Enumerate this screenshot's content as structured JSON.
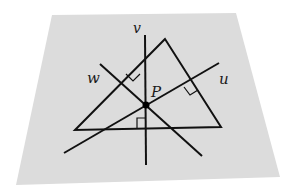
{
  "figure": {
    "plane": {
      "fill": "#dcdcdc",
      "corners": [
        [
          52,
          15
        ],
        [
          236,
          13
        ],
        [
          280,
          177
        ],
        [
          16,
          185
        ]
      ]
    },
    "stroke_color": "#111111",
    "triangle": {
      "vertices": [
        [
          165,
          39
        ],
        [
          75,
          130
        ],
        [
          221,
          127
        ]
      ]
    },
    "lines": [
      {
        "name": "v",
        "label": "v",
        "from": [
          145,
          35
        ],
        "to": [
          146,
          165
        ],
        "label_pos": [
          133,
          33
        ]
      },
      {
        "name": "u",
        "label": "u",
        "from": [
          64,
          153
        ],
        "to": [
          219,
          63
        ],
        "label_pos": [
          219,
          84
        ]
      },
      {
        "name": "w",
        "label": "w",
        "from": [
          100,
          64
        ],
        "to": [
          202,
          156
        ],
        "label_pos": [
          87,
          83
        ]
      }
    ],
    "point": {
      "label": "P",
      "pos": [
        146,
        105
      ],
      "label_pos": [
        151,
        97
      ]
    },
    "right_angle_marks": [
      "w-left-side",
      "u-right-side",
      "v-base"
    ]
  }
}
